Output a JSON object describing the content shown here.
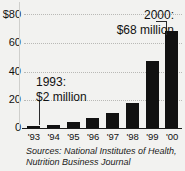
{
  "chart_data": {
    "type": "bar",
    "title": "",
    "subtitle": "",
    "xlabel": "",
    "ylabel": "",
    "categories": [
      "'93",
      "'94",
      "'95",
      "'96",
      "'97",
      "'98",
      "'99",
      "'00"
    ],
    "values": [
      2,
      3,
      5,
      8,
      11,
      18,
      47,
      68
    ],
    "ylim": [
      0,
      80
    ],
    "yticks": [
      0,
      20,
      40,
      60,
      80
    ],
    "ytick_labels": [
      "0",
      "20",
      "40",
      "60",
      "$80"
    ],
    "grid": "horizontal-dotted",
    "legend": "none",
    "bar_color": "#111111",
    "units": "millions of dollars",
    "annotations": [
      {
        "id": "callout-1993",
        "line1": "1993:",
        "line2": "$2 million",
        "target_category": "'93",
        "target_value": 2
      },
      {
        "id": "callout-2000",
        "line1": "2000:",
        "line2": "$68 million",
        "target_category": "'00",
        "target_value": 68
      }
    ]
  },
  "source": {
    "line1": "Sources: National Institutes of Health,",
    "line2": "Nutrition Business Journal"
  },
  "colors": {
    "background": "#f2f2f0",
    "bar": "#111111",
    "gridline": "#b9b9b6",
    "axis": "#1a1a1a",
    "text": "#111111"
  }
}
